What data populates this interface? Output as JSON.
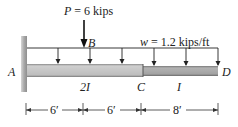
{
  "diagram": {
    "type": "cantilever-beam-loading",
    "point_load": {
      "symbol": "P",
      "text": "P = 6 kips",
      "value": 6,
      "unit": "kips",
      "location": "B"
    },
    "distributed_load": {
      "symbol": "w",
      "text": "w = 1.2 kips/ft",
      "value": 1.2,
      "unit": "kips/ft"
    },
    "points": {
      "A": "A",
      "B": "B",
      "C": "C",
      "D": "D"
    },
    "segments": [
      {
        "label": "2I",
        "from": "A",
        "to": "C"
      },
      {
        "label": "I",
        "from": "C",
        "to": "D"
      }
    ],
    "dimensions": [
      {
        "label": "6′",
        "from": "A",
        "to": "B"
      },
      {
        "label": "6′",
        "from": "B",
        "to": "C"
      },
      {
        "label": "8′",
        "from": "C",
        "to": "D"
      }
    ],
    "colors": {
      "wall": "#a9a9a9",
      "beam_2I": "#c4c4c4",
      "beam_I": "#a6a6a6",
      "line": "#222222"
    }
  }
}
